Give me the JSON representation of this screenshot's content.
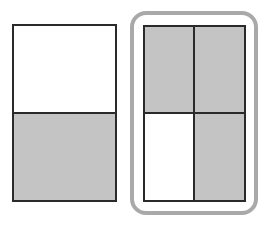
{
  "diagram": {
    "colors": {
      "shaded": "#c4c4c4",
      "unshaded": "#ffffff",
      "border": "#2a2a2a",
      "highlight": "#a9a9a9"
    },
    "left_shape": {
      "parts": 2,
      "shaded_parts": 1,
      "fraction": "1/2",
      "cells": [
        {
          "position": "top",
          "shaded": false
        },
        {
          "position": "bottom",
          "shaded": true
        }
      ]
    },
    "right_shape": {
      "parts": 4,
      "shaded_parts": 3,
      "fraction": "3/4",
      "highlighted": true,
      "cells": [
        {
          "position": "top-left",
          "shaded": true
        },
        {
          "position": "top-right",
          "shaded": true
        },
        {
          "position": "bottom-left",
          "shaded": false
        },
        {
          "position": "bottom-right",
          "shaded": true
        }
      ]
    }
  }
}
